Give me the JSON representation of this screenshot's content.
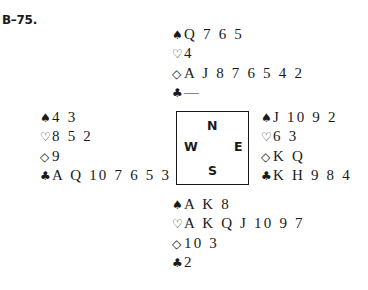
{
  "title": "B–75.",
  "compass": {
    "north": "N",
    "south": "S",
    "east": "E",
    "west": "W"
  },
  "suit_symbols": {
    "spades": "♠",
    "hearts": "♡",
    "diamonds": "◇",
    "clubs": "♣"
  },
  "hands": {
    "north": {
      "spades": "Q 7 6 5",
      "hearts": "4",
      "diamonds": "A J 8 7 6 5 4 2",
      "clubs": "—"
    },
    "west": {
      "spades": "4 3",
      "hearts": "8 5 2",
      "diamonds": "9",
      "clubs": "A Q 10 7 6 5 3"
    },
    "east": {
      "spades": "J 10 9 2",
      "hearts": "6 3",
      "diamonds": "K Q",
      "clubs": "K H 9 8 4"
    },
    "south": {
      "spades": "A K 8",
      "hearts": "A K Q J 10 9 7",
      "diamonds": "10 3",
      "clubs": "2"
    }
  }
}
